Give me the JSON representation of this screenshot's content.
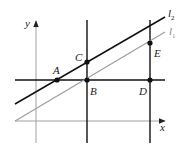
{
  "figure": {
    "type": "geometry-diagram",
    "axes": {
      "x_label": "x",
      "y_label": "y"
    },
    "lines": [
      {
        "name": "l2",
        "label_main": "l",
        "label_sub": "2",
        "color": "#111111",
        "description": "black slanted line through A and C"
      },
      {
        "name": "l1",
        "label_main": "l",
        "label_sub": "1",
        "color": "#a0a0a0",
        "description": "gray slanted line through B and E, parallel to l2"
      }
    ],
    "guide_lines": [
      {
        "name": "horizontal",
        "description": "horizontal black line through A, B, D"
      },
      {
        "name": "vertical-bc",
        "description": "vertical black line through C and B"
      },
      {
        "name": "vertical-de",
        "description": "vertical black line through E and D"
      }
    ],
    "points": [
      {
        "name": "A",
        "label": "A"
      },
      {
        "name": "B",
        "label": "B"
      },
      {
        "name": "C",
        "label": "C"
      },
      {
        "name": "D",
        "label": "D"
      },
      {
        "name": "E",
        "label": "E"
      }
    ],
    "colors": {
      "axis": "#a0a0a0",
      "line_l1": "#a0a0a0",
      "line_l2": "#111111",
      "guide": "#111111",
      "point": "#111111"
    }
  }
}
